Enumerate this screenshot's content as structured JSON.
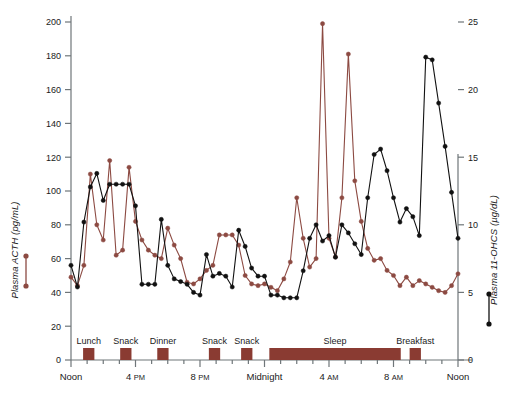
{
  "chart_data": {
    "type": "line",
    "title": "",
    "xlabel": "",
    "ylabel": "Plasma ACTH (pg/mL)",
    "y2label": "Plasma 11-OHCS (µg/dL)",
    "xlim": [
      12,
      36
    ],
    "ylim": [
      0,
      200
    ],
    "y2lim": [
      0,
      25
    ],
    "grid": false,
    "legend_position": "outside-left-and-right-axis",
    "x_tick_labels": [
      {
        "hour": 12,
        "text": "Noon",
        "small": ""
      },
      {
        "hour": 16,
        "text": "4",
        "small": "PM"
      },
      {
        "hour": 20,
        "text": "8",
        "small": "PM"
      },
      {
        "hour": 24,
        "text": "Midnight",
        "small": ""
      },
      {
        "hour": 28,
        "text": "4",
        "small": "AM"
      },
      {
        "hour": 32,
        "text": "8",
        "small": "AM"
      },
      {
        "hour": 36,
        "text": "Noon",
        "small": ""
      }
    ],
    "y_tick_labels": [
      "0",
      "20",
      "40",
      "60",
      "80",
      "100",
      "120",
      "140",
      "160",
      "180",
      "200"
    ],
    "y2_tick_labels": [
      "0",
      "5",
      "10",
      "15",
      "20",
      "25"
    ],
    "events": [
      {
        "label": "Lunch",
        "start": 12.75,
        "end": 13.45
      },
      {
        "label": "Snack",
        "start": 15.05,
        "end": 15.75
      },
      {
        "label": "Dinner",
        "start": 17.35,
        "end": 18.05
      },
      {
        "label": "Snack",
        "start": 20.55,
        "end": 21.25
      },
      {
        "label": "Snack",
        "start": 22.55,
        "end": 23.25
      },
      {
        "label": "Sleep",
        "start": 24.3,
        "end": 32.45
      },
      {
        "label": "Breakfast",
        "start": 33.0,
        "end": 33.7
      }
    ],
    "series": [
      {
        "name": "Plasma ACTH (pg/mL)",
        "color": "#8c4a42",
        "axis": "left",
        "x": [
          12.0,
          12.4,
          12.8,
          13.2,
          13.6,
          14.0,
          14.4,
          14.8,
          15.2,
          15.6,
          16.0,
          16.4,
          16.8,
          17.2,
          17.6,
          18.0,
          18.4,
          18.8,
          19.2,
          19.6,
          20.0,
          20.4,
          20.8,
          21.2,
          21.6,
          22.0,
          22.4,
          22.8,
          23.2,
          23.6,
          24.0,
          24.4,
          24.8,
          25.2,
          25.6,
          26.0,
          26.4,
          26.8,
          27.2,
          27.6,
          28.0,
          28.4,
          28.8,
          29.2,
          29.6,
          30.0,
          30.4,
          30.8,
          31.2,
          31.6,
          32.0,
          32.4,
          32.8,
          33.2,
          33.6,
          34.0,
          34.4,
          34.8,
          35.2,
          35.6,
          36.0
        ],
        "y": [
          49,
          44,
          56,
          110,
          80,
          71,
          118,
          62,
          65,
          114,
          82,
          71,
          65,
          62,
          60,
          78,
          68,
          60,
          46,
          45,
          48,
          53,
          56,
          74,
          74,
          74,
          68,
          50,
          45,
          44,
          45,
          43,
          41,
          48,
          58,
          96,
          72,
          55,
          60,
          199,
          72,
          61,
          96,
          181,
          106,
          82,
          66,
          59,
          60,
          53,
          50,
          44,
          49,
          44,
          47,
          45,
          43,
          41,
          40,
          44,
          51
        ]
      },
      {
        "name": "Plasma 11-OHCS (µg/dL)",
        "color": "#111111",
        "axis": "right",
        "x": [
          12.0,
          12.4,
          12.8,
          13.2,
          13.6,
          14.0,
          14.4,
          14.8,
          15.2,
          15.6,
          16.0,
          16.4,
          16.8,
          17.2,
          17.6,
          18.0,
          18.4,
          18.8,
          19.2,
          19.6,
          20.0,
          20.4,
          20.8,
          21.2,
          21.6,
          22.0,
          22.4,
          22.8,
          23.2,
          23.6,
          24.0,
          24.4,
          24.8,
          25.2,
          25.6,
          26.0,
          26.4,
          26.8,
          27.2,
          27.6,
          28.0,
          28.4,
          28.8,
          29.2,
          29.6,
          30.0,
          30.4,
          30.8,
          31.2,
          31.6,
          32.0,
          32.4,
          32.8,
          33.2,
          33.6,
          34.0,
          34.4,
          34.8,
          35.2,
          35.6,
          36.0
        ],
        "y": [
          7.0,
          5.4,
          10.2,
          12.8,
          13.8,
          11.8,
          13.0,
          13.0,
          13.0,
          13.0,
          11.4,
          5.6,
          5.6,
          5.6,
          10.4,
          7.0,
          6.0,
          5.8,
          5.6,
          5.0,
          4.8,
          7.8,
          6.2,
          6.4,
          6.2,
          5.4,
          9.6,
          8.4,
          6.8,
          6.2,
          6.2,
          4.8,
          4.8,
          4.6,
          4.6,
          4.6,
          6.6,
          9.0,
          10.0,
          8.8,
          9.2,
          7.6,
          10.0,
          9.4,
          8.6,
          7.8,
          12.0,
          15.2,
          15.6,
          14.0,
          12.0,
          10.2,
          11.2,
          10.6,
          9.2,
          22.4,
          22.2,
          19.0,
          15.8,
          12.4,
          9.0
        ]
      }
    ]
  }
}
